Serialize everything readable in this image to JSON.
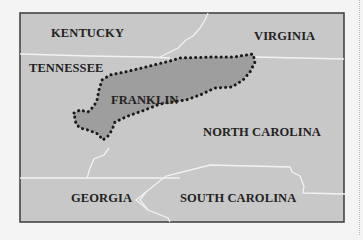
{
  "map": {
    "regions": [
      {
        "name": "KENTUCKY",
        "label": "KENTUCKY"
      },
      {
        "name": "VIRGINIA",
        "label": "VIRGINIA"
      },
      {
        "name": "TENNESSEE",
        "label": "TENNESSEE"
      },
      {
        "name": "FRANKLIN",
        "label": "FRANKLIN",
        "highlighted": true
      },
      {
        "name": "NORTH CAROLINA",
        "label": "NORTH CAROLINA"
      },
      {
        "name": "GEORGIA",
        "label": "GEORGIA"
      },
      {
        "name": "SOUTH CAROLINA",
        "label": "SOUTH CAROLINA"
      }
    ],
    "colors": {
      "background": "#f4f4f4",
      "land": "#c8c8c8",
      "franklin_fill": "#9e9e9e",
      "border_lines": "#f2f2f2",
      "frame": "#3a3a3a",
      "franklin_outline": "#1a1a1a",
      "label_text": "#222222"
    }
  }
}
